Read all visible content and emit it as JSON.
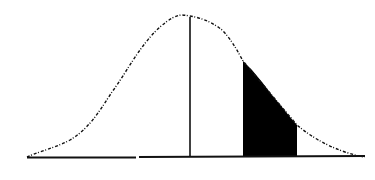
{
  "diagram": {
    "top_caption": "",
    "colors": {
      "background": "#ffffff",
      "curve": "#111111",
      "shade": "#000000",
      "axis": "#111111"
    },
    "curve": {
      "type": "normal-bell-curve",
      "style": "dotted-dashed",
      "peak": {
        "x": 182,
        "y": 15
      },
      "left_end": {
        "x": 27,
        "y": 157
      },
      "right_end": {
        "x": 365,
        "y": 157
      }
    },
    "baseline": {
      "x1": 27,
      "x2": 365,
      "y": 157
    },
    "mean_line": {
      "x": 190,
      "y_top": 17,
      "y_bottom": 157
    },
    "shaded_region": {
      "x_left": 243,
      "x_right": 297,
      "y_top_left": 61,
      "y_top_right": 125,
      "y_bottom": 157
    }
  }
}
